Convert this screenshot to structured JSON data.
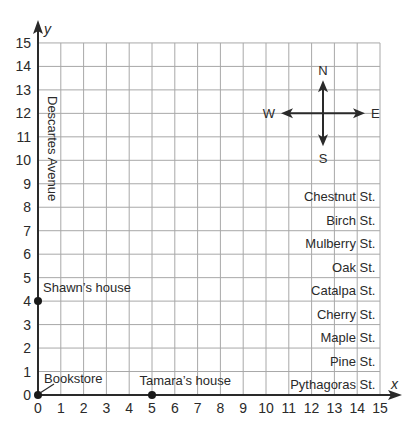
{
  "chart_data": {
    "type": "scatter",
    "title": "",
    "xlabel": "x",
    "ylabel": "y",
    "xlim": [
      0,
      15
    ],
    "ylim": [
      0,
      15
    ],
    "grid": true,
    "x_ticks": [
      "0",
      "1",
      "2",
      "3",
      "4",
      "5",
      "6",
      "7",
      "8",
      "9",
      "10",
      "11",
      "12",
      "13",
      "14",
      "15"
    ],
    "y_ticks": [
      "0",
      "1",
      "2",
      "3",
      "4",
      "5",
      "6",
      "7",
      "8",
      "9",
      "10",
      "11",
      "12",
      "13",
      "14",
      "15"
    ],
    "points": [
      {
        "label": "Bookstore",
        "x": 0,
        "y": 0
      },
      {
        "label": "Tamara’s house",
        "x": 5,
        "y": 0
      },
      {
        "label": "Shawn’s house",
        "x": 0,
        "y": 4
      }
    ],
    "avenue_label": "Descartes Avenue",
    "streets": [
      {
        "label": "Pythagoras St.",
        "y": 0
      },
      {
        "label": "Pine St.",
        "y": 1
      },
      {
        "label": "Maple St.",
        "y": 2
      },
      {
        "label": "Cherry St.",
        "y": 3
      },
      {
        "label": "Catalpa St.",
        "y": 4
      },
      {
        "label": "Oak St.",
        "y": 5
      },
      {
        "label": "Mulberry St.",
        "y": 6
      },
      {
        "label": "Birch St.",
        "y": 7
      },
      {
        "label": "Chestnut St.",
        "y": 8
      }
    ],
    "compass": {
      "n": "N",
      "s": "S",
      "e": "E",
      "w": "W"
    }
  }
}
